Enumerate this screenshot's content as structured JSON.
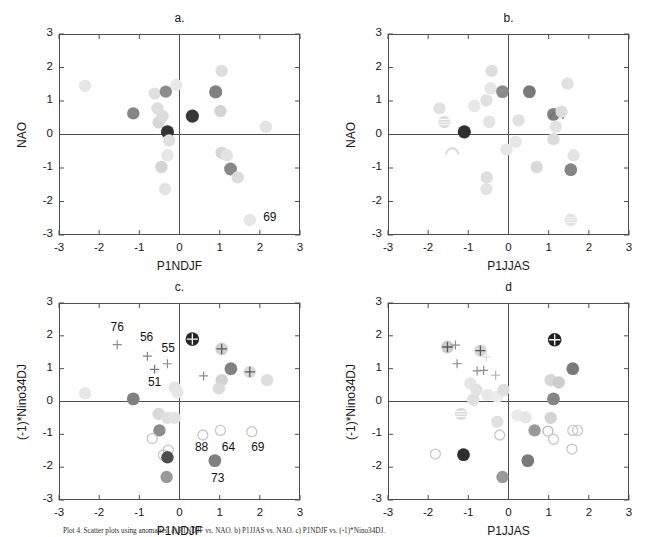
{
  "figure": {
    "width": 657,
    "height": 537,
    "background": "#ffffff",
    "axis_color": "#4d4d4d",
    "caption_text": "Plot 4. Scatter plots using anomalies. a) P1NDJF vs. NAO. b) P1JJAS vs. NAO. c) P1NDJF vs. (-1)*Nino34DJ."
  },
  "axes": {
    "xlim": [
      -3,
      3
    ],
    "ylim": [
      -3,
      3
    ],
    "xticks": [
      -3,
      -2,
      -1,
      0,
      1,
      2,
      3
    ],
    "yticks": [
      3,
      2,
      1,
      0,
      -1,
      -2,
      -3
    ],
    "xtick_labels": [
      "-3",
      "-2",
      "-1",
      "0",
      "1",
      "2",
      "3"
    ],
    "ytick_labels": [
      "3",
      "2",
      "1",
      "0",
      "-1",
      "-2",
      "-3"
    ],
    "grid": false
  },
  "chart_data": [
    {
      "id": "panel-a",
      "type": "scatter",
      "title": "a.",
      "xlabel": "P1NDJF",
      "ylabel": "NAO",
      "xlim": [
        -3,
        3
      ],
      "ylim": [
        -3,
        3
      ],
      "grid": false,
      "legend": "none",
      "points": [
        {
          "x": -2.35,
          "y": 1.45,
          "shade": 0.9,
          "r": 6.2,
          "marker": "filled-circle"
        },
        {
          "x": -1.15,
          "y": 0.63,
          "shade": 0.52,
          "r": 6.2,
          "marker": "filled-circle"
        },
        {
          "x": -0.62,
          "y": 1.22,
          "shade": 0.88,
          "r": 6.2,
          "marker": "filled-circle"
        },
        {
          "x": -0.55,
          "y": 0.78,
          "shade": 0.87,
          "r": 6.2,
          "marker": "filled-circle"
        },
        {
          "x": -0.52,
          "y": 0.36,
          "shade": 0.84,
          "r": 6.2,
          "marker": "filled-circle"
        },
        {
          "x": -0.42,
          "y": 0.55,
          "shade": 0.86,
          "r": 6.2,
          "marker": "filled-circle"
        },
        {
          "x": -0.34,
          "y": 1.28,
          "shade": 0.55,
          "r": 6.2,
          "marker": "filled-circle"
        },
        {
          "x": -0.3,
          "y": 0.08,
          "shade": 0.2,
          "r": 6.6,
          "marker": "filled-circle"
        },
        {
          "x": -0.26,
          "y": -0.18,
          "shade": 0.88,
          "r": 6.2,
          "marker": "filled-circle"
        },
        {
          "x": -0.3,
          "y": -0.62,
          "shade": 0.9,
          "r": 6.2,
          "marker": "filled-circle"
        },
        {
          "x": -0.45,
          "y": -0.97,
          "shade": 0.83,
          "r": 6.2,
          "marker": "filled-circle"
        },
        {
          "x": -0.36,
          "y": -1.63,
          "shade": 0.89,
          "r": 6.2,
          "marker": "filled-circle"
        },
        {
          "x": -0.08,
          "y": 1.48,
          "shade": 0.91,
          "r": 6.2,
          "marker": "filled-circle"
        },
        {
          "x": 0.32,
          "y": 0.55,
          "shade": 0.22,
          "r": 6.6,
          "marker": "filled-circle"
        },
        {
          "x": 0.9,
          "y": 1.27,
          "shade": 0.5,
          "r": 6.6,
          "marker": "filled-circle"
        },
        {
          "x": 1.05,
          "y": 1.9,
          "shade": 0.87,
          "r": 6.2,
          "marker": "filled-circle"
        },
        {
          "x": 1.02,
          "y": 0.7,
          "shade": 0.83,
          "r": 6.2,
          "marker": "filled-circle"
        },
        {
          "x": 1.05,
          "y": -0.55,
          "shade": 0.84,
          "r": 6.2,
          "marker": "filled-circle"
        },
        {
          "x": 1.18,
          "y": -0.62,
          "shade": 0.89,
          "r": 6.2,
          "marker": "filled-circle"
        },
        {
          "x": 1.27,
          "y": -1.03,
          "shade": 0.53,
          "r": 6.4,
          "marker": "filled-circle"
        },
        {
          "x": 1.45,
          "y": -1.28,
          "shade": 0.86,
          "r": 6.2,
          "marker": "filled-circle"
        },
        {
          "x": 2.15,
          "y": 0.23,
          "shade": 0.89,
          "r": 6.2,
          "marker": "filled-circle"
        },
        {
          "x": 1.75,
          "y": -2.55,
          "shade": 0.9,
          "r": 6.2,
          "marker": "filled-circle"
        }
      ],
      "annotations": [
        {
          "text": "69",
          "x": 2.25,
          "y": -2.48
        }
      ]
    },
    {
      "id": "panel-b",
      "type": "scatter",
      "title": "b.",
      "xlabel": "P1JJAS",
      "ylabel": "NAO",
      "xlim": [
        -3,
        3
      ],
      "ylim": [
        -3,
        3
      ],
      "grid": false,
      "legend": "none",
      "points": [
        {
          "x": -1.72,
          "y": 0.78,
          "shade": 0.88,
          "r": 6.2,
          "marker": "filled-circle"
        },
        {
          "x": -1.6,
          "y": 0.37,
          "shade": 0.86,
          "r": 6.2,
          "marker": "striped-circle"
        },
        {
          "x": -1.1,
          "y": 0.08,
          "shade": 0.18,
          "r": 6.6,
          "marker": "filled-circle"
        },
        {
          "x": -1.4,
          "y": -0.57,
          "shade": 0.86,
          "r": 6.2,
          "marker": "arc"
        },
        {
          "x": -0.85,
          "y": 0.85,
          "shade": 0.9,
          "r": 6.2,
          "marker": "filled-circle"
        },
        {
          "x": -0.55,
          "y": 1.02,
          "shade": 0.88,
          "r": 6.2,
          "marker": "filled-circle"
        },
        {
          "x": -0.42,
          "y": 1.9,
          "shade": 0.87,
          "r": 6.2,
          "marker": "filled-circle"
        },
        {
          "x": -0.44,
          "y": 1.38,
          "shade": 0.9,
          "r": 6.2,
          "marker": "filled-circle"
        },
        {
          "x": -0.48,
          "y": 0.38,
          "shade": 0.89,
          "r": 6.2,
          "marker": "filled-circle"
        },
        {
          "x": -0.54,
          "y": -1.28,
          "shade": 0.87,
          "r": 6.2,
          "marker": "filled-circle"
        },
        {
          "x": -0.55,
          "y": -1.63,
          "shade": 0.89,
          "r": 6.2,
          "marker": "filled-circle"
        },
        {
          "x": -0.15,
          "y": 1.28,
          "shade": 0.55,
          "r": 6.4,
          "marker": "filled-circle"
        },
        {
          "x": -0.05,
          "y": -0.45,
          "shade": 0.9,
          "r": 6.2,
          "marker": "filled-circle"
        },
        {
          "x": 0.25,
          "y": 0.42,
          "shade": 0.88,
          "r": 6.2,
          "marker": "filled-circle"
        },
        {
          "x": 0.18,
          "y": -0.22,
          "shade": 0.9,
          "r": 6.2,
          "marker": "filled-circle"
        },
        {
          "x": 0.52,
          "y": 1.28,
          "shade": 0.48,
          "r": 6.4,
          "marker": "filled-circle"
        },
        {
          "x": 0.7,
          "y": -0.97,
          "shade": 0.85,
          "r": 6.2,
          "marker": "filled-circle"
        },
        {
          "x": 1.12,
          "y": 0.6,
          "shade": 0.5,
          "r": 6.4,
          "marker": "filled-circle"
        },
        {
          "x": 1.2,
          "y": 0.5,
          "shade": 0.45,
          "r": 6.4,
          "marker": "arc"
        },
        {
          "x": 1.32,
          "y": 0.68,
          "shade": 0.86,
          "r": 6.2,
          "marker": "filled-circle"
        },
        {
          "x": 1.18,
          "y": 0.23,
          "shade": 0.89,
          "r": 6.2,
          "marker": "filled-circle"
        },
        {
          "x": 1.12,
          "y": -0.14,
          "shade": 0.86,
          "r": 6.2,
          "marker": "filled-circle"
        },
        {
          "x": 1.47,
          "y": 1.52,
          "shade": 0.88,
          "r": 6.2,
          "marker": "filled-circle"
        },
        {
          "x": 1.55,
          "y": -1.05,
          "shade": 0.52,
          "r": 6.4,
          "marker": "filled-circle"
        },
        {
          "x": 1.62,
          "y": -0.62,
          "shade": 0.89,
          "r": 6.2,
          "marker": "filled-circle"
        },
        {
          "x": 1.55,
          "y": -2.55,
          "shade": 0.87,
          "r": 6.2,
          "marker": "striped-circle"
        }
      ],
      "annotations": []
    },
    {
      "id": "panel-c",
      "type": "scatter",
      "title": "c.",
      "xlabel": "P1NDJF",
      "ylabel": "(-1)*Nino34DJ",
      "xlim": [
        -3,
        3
      ],
      "ylim": [
        -3,
        3
      ],
      "grid": false,
      "legend": "none",
      "points": [
        {
          "x": -1.55,
          "y": 1.73,
          "shade": 0.55,
          "r": 4.5,
          "marker": "plus"
        },
        {
          "x": -2.35,
          "y": 0.25,
          "shade": 0.9,
          "r": 6.2,
          "marker": "filled-circle"
        },
        {
          "x": -1.15,
          "y": 0.08,
          "shade": 0.5,
          "r": 6.4,
          "marker": "filled-circle"
        },
        {
          "x": -0.8,
          "y": 1.38,
          "shade": 0.5,
          "r": 4.5,
          "marker": "plus"
        },
        {
          "x": -0.62,
          "y": 0.98,
          "shade": 0.45,
          "r": 4.5,
          "marker": "plus"
        },
        {
          "x": -0.3,
          "y": 1.15,
          "shade": 0.55,
          "r": 4.5,
          "marker": "plus"
        },
        {
          "x": -0.12,
          "y": 0.43,
          "shade": 0.89,
          "r": 6.2,
          "marker": "filled-circle"
        },
        {
          "x": -0.05,
          "y": 0.28,
          "shade": 0.9,
          "r": 6.2,
          "marker": "filled-circle"
        },
        {
          "x": -0.52,
          "y": -0.38,
          "shade": 0.85,
          "r": 6.2,
          "marker": "filled-circle"
        },
        {
          "x": -0.3,
          "y": -0.5,
          "shade": 0.88,
          "r": 6.2,
          "marker": "filled-circle"
        },
        {
          "x": -0.12,
          "y": -0.5,
          "shade": 0.89,
          "r": 6.2,
          "marker": "filled-circle"
        },
        {
          "x": -0.5,
          "y": -0.88,
          "shade": 0.55,
          "r": 6.2,
          "marker": "filled-circle"
        },
        {
          "x": -0.68,
          "y": -1.13,
          "shade": 0.96,
          "r": 6.2,
          "marker": "open-circle"
        },
        {
          "x": -0.28,
          "y": -1.48,
          "shade": 0.96,
          "r": 6.2,
          "marker": "open-circle"
        },
        {
          "x": -0.4,
          "y": -1.63,
          "shade": 0.94,
          "r": 6.2,
          "marker": "open-circle"
        },
        {
          "x": -0.3,
          "y": -1.7,
          "shade": 0.3,
          "r": 6.2,
          "marker": "filled-circle"
        },
        {
          "x": -0.32,
          "y": -2.3,
          "shade": 0.6,
          "r": 6.2,
          "marker": "filled-circle"
        },
        {
          "x": 0.32,
          "y": 1.9,
          "shade": 0.15,
          "r": 6.8,
          "marker": "plus-circle"
        },
        {
          "x": 0.6,
          "y": 0.78,
          "shade": 0.55,
          "r": 4.5,
          "marker": "plus"
        },
        {
          "x": 1.05,
          "y": 1.6,
          "shade": 0.82,
          "r": 6.4,
          "marker": "plus-circle"
        },
        {
          "x": 1.28,
          "y": 1.0,
          "shade": 0.5,
          "r": 6.4,
          "marker": "filled-circle"
        },
        {
          "x": 1.05,
          "y": 0.65,
          "shade": 0.82,
          "r": 6.2,
          "marker": "filled-circle"
        },
        {
          "x": 0.98,
          "y": 0.4,
          "shade": 0.86,
          "r": 6.2,
          "marker": "filled-circle"
        },
        {
          "x": 1.75,
          "y": 0.9,
          "shade": 0.86,
          "r": 6.2,
          "marker": "plus-circle"
        },
        {
          "x": 2.18,
          "y": 0.65,
          "shade": 0.87,
          "r": 6.2,
          "marker": "filled-circle"
        },
        {
          "x": 0.58,
          "y": -1.02,
          "shade": 0.96,
          "r": 6.2,
          "marker": "open-circle"
        },
        {
          "x": 1.02,
          "y": -0.88,
          "shade": 0.94,
          "r": 6.2,
          "marker": "open-circle"
        },
        {
          "x": 1.8,
          "y": -0.92,
          "shade": 0.94,
          "r": 6.2,
          "marker": "open-circle"
        },
        {
          "x": 0.88,
          "y": -1.8,
          "shade": 0.5,
          "r": 6.4,
          "marker": "filled-circle"
        }
      ],
      "annotations": [
        {
          "text": "76",
          "x": -1.55,
          "y": 2.25
        },
        {
          "text": "56",
          "x": -0.82,
          "y": 1.92
        },
        {
          "text": "55",
          "x": -0.28,
          "y": 1.6
        },
        {
          "text": "51",
          "x": -0.62,
          "y": 0.55
        },
        {
          "text": "88",
          "x": 0.55,
          "y": -1.43
        },
        {
          "text": "64",
          "x": 1.22,
          "y": -1.43
        },
        {
          "text": "69",
          "x": 1.95,
          "y": -1.43
        },
        {
          "text": "73",
          "x": 0.95,
          "y": -2.35
        }
      ]
    },
    {
      "id": "panel-d",
      "type": "scatter",
      "title": "d",
      "xlabel": "P1JJAS",
      "ylabel": "(-1)*Nino34DJ",
      "xlim": [
        -3,
        3
      ],
      "ylim": [
        -3,
        3
      ],
      "grid": false,
      "legend": "none",
      "points": [
        {
          "x": -1.52,
          "y": 1.66,
          "shade": 0.8,
          "r": 6.4,
          "marker": "plus-circle"
        },
        {
          "x": -1.32,
          "y": 1.72,
          "shade": 0.55,
          "r": 4.5,
          "marker": "plus"
        },
        {
          "x": -1.28,
          "y": 1.15,
          "shade": 0.55,
          "r": 4.5,
          "marker": "plus"
        },
        {
          "x": -0.7,
          "y": 1.55,
          "shade": 0.84,
          "r": 6.2,
          "marker": "plus-circle"
        },
        {
          "x": -0.55,
          "y": 1.35,
          "shade": 0.86,
          "r": 4.5,
          "marker": "plus"
        },
        {
          "x": -0.78,
          "y": 0.93,
          "shade": 0.55,
          "r": 4.5,
          "marker": "plus"
        },
        {
          "x": -0.62,
          "y": 0.95,
          "shade": 0.55,
          "r": 4.5,
          "marker": "plus"
        },
        {
          "x": -0.32,
          "y": 0.8,
          "shade": 0.7,
          "r": 4.5,
          "marker": "plus"
        },
        {
          "x": -0.95,
          "y": 0.55,
          "shade": 0.9,
          "r": 6.2,
          "marker": "filled-circle"
        },
        {
          "x": -0.8,
          "y": 0.35,
          "shade": 0.89,
          "r": 6.2,
          "marker": "filled-circle"
        },
        {
          "x": -0.88,
          "y": 0.05,
          "shade": 0.88,
          "r": 6.2,
          "marker": "filled-circle"
        },
        {
          "x": -0.52,
          "y": 0.2,
          "shade": 0.91,
          "r": 6.2,
          "marker": "filled-circle"
        },
        {
          "x": -0.28,
          "y": 0.15,
          "shade": 0.92,
          "r": 6.2,
          "marker": "filled-circle"
        },
        {
          "x": -0.12,
          "y": 0.35,
          "shade": 0.87,
          "r": 6.2,
          "marker": "filled-circle"
        },
        {
          "x": -1.18,
          "y": -0.38,
          "shade": 0.86,
          "r": 6.2,
          "marker": "striped-circle"
        },
        {
          "x": -0.28,
          "y": -0.62,
          "shade": 0.88,
          "r": 6.2,
          "marker": "filled-circle"
        },
        {
          "x": -0.22,
          "y": -1.02,
          "shade": 0.97,
          "r": 6.2,
          "marker": "open-circle"
        },
        {
          "x": -1.82,
          "y": -1.6,
          "shade": 0.88,
          "r": 6.2,
          "marker": "open-circle"
        },
        {
          "x": -1.12,
          "y": -1.62,
          "shade": 0.18,
          "r": 6.4,
          "marker": "filled-circle"
        },
        {
          "x": -0.15,
          "y": -2.3,
          "shade": 0.6,
          "r": 6.2,
          "marker": "filled-circle"
        },
        {
          "x": 1.15,
          "y": 1.88,
          "shade": 0.12,
          "r": 6.8,
          "marker": "plus-circle"
        },
        {
          "x": 1.6,
          "y": 1.0,
          "shade": 0.48,
          "r": 6.4,
          "marker": "filled-circle"
        },
        {
          "x": 1.05,
          "y": 0.65,
          "shade": 0.84,
          "r": 6.2,
          "marker": "filled-circle"
        },
        {
          "x": 1.25,
          "y": 0.58,
          "shade": 0.8,
          "r": 6.2,
          "marker": "filled-circle"
        },
        {
          "x": 1.12,
          "y": 0.08,
          "shade": 0.52,
          "r": 6.4,
          "marker": "filled-circle"
        },
        {
          "x": 1.05,
          "y": -0.5,
          "shade": 0.83,
          "r": 6.2,
          "marker": "filled-circle"
        },
        {
          "x": 0.22,
          "y": -0.42,
          "shade": 0.92,
          "r": 6.2,
          "marker": "filled-circle"
        },
        {
          "x": 0.42,
          "y": -0.48,
          "shade": 0.9,
          "r": 6.2,
          "marker": "filled-circle"
        },
        {
          "x": 0.65,
          "y": -0.88,
          "shade": 0.6,
          "r": 6.2,
          "marker": "filled-circle"
        },
        {
          "x": 0.98,
          "y": -0.9,
          "shade": 0.72,
          "r": 6.2,
          "marker": "open-circle"
        },
        {
          "x": 1.6,
          "y": -0.88,
          "shade": 0.82,
          "r": 6.2,
          "marker": "open-circle"
        },
        {
          "x": 1.72,
          "y": -0.88,
          "shade": 0.94,
          "r": 6.2,
          "marker": "open-circle"
        },
        {
          "x": 1.12,
          "y": -1.15,
          "shade": 0.96,
          "r": 6.2,
          "marker": "open-circle"
        },
        {
          "x": 1.58,
          "y": -1.45,
          "shade": 0.95,
          "r": 6.2,
          "marker": "open-circle"
        },
        {
          "x": 0.48,
          "y": -1.8,
          "shade": 0.48,
          "r": 6.4,
          "marker": "filled-circle"
        }
      ],
      "annotations": []
    }
  ]
}
